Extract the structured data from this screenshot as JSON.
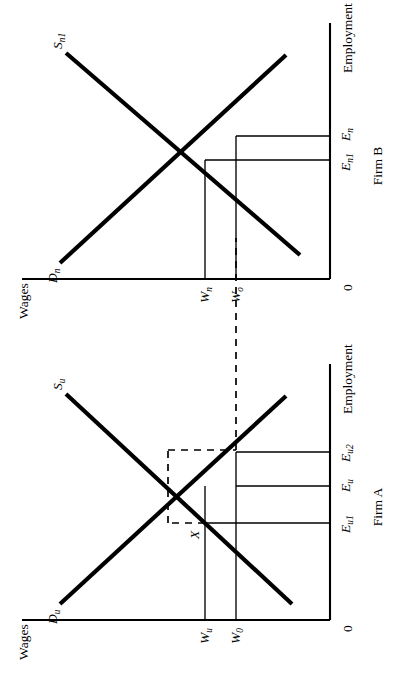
{
  "figure": {
    "title": "",
    "orientation": "page rotated 90 degrees counter-clockwise",
    "panels": [
      {
        "id": "firm-a",
        "caption": "Firm A",
        "origin_label": "0",
        "y_axis_label": "Wages",
        "x_axis_label": "Employment",
        "curves": [
          {
            "name": "demand",
            "label_base": "D",
            "label_sub": "u",
            "slope": "downward"
          },
          {
            "name": "supply",
            "label_base": "S",
            "label_sub": "u",
            "slope": "upward"
          }
        ],
        "wage_ticks": [
          {
            "base": "W",
            "sub": "u"
          },
          {
            "base": "W",
            "sub": "0"
          }
        ],
        "employment_ticks": [
          {
            "base": "E",
            "sub": "u1"
          },
          {
            "base": "E",
            "sub": "u"
          },
          {
            "base": "E",
            "sub": "u2"
          }
        ],
        "point_labels": [
          {
            "base": "X",
            "sub": ""
          }
        ]
      },
      {
        "id": "firm-b",
        "caption": "Firm B",
        "origin_label": "0",
        "y_axis_label": "Wages",
        "x_axis_label": "Employment",
        "curves": [
          {
            "name": "demand",
            "label_base": "D",
            "label_sub": "n",
            "slope": "downward"
          },
          {
            "name": "supply",
            "label_base": "S",
            "label_sub": "n1",
            "slope": "upward"
          }
        ],
        "wage_ticks": [
          {
            "base": "W",
            "sub": "n"
          },
          {
            "base": "W",
            "sub": "o"
          }
        ],
        "employment_ticks": [
          {
            "base": "E",
            "sub": "n1"
          },
          {
            "base": "E",
            "sub": "n"
          }
        ],
        "point_labels": []
      }
    ],
    "connector": {
      "name": "spillover-dashed-link",
      "style": "dashed",
      "from": "Firm A wage W0 level",
      "to": "Firm B wage Wo level"
    },
    "colors": {
      "ink": "#000000",
      "paper": "#ffffff"
    }
  }
}
